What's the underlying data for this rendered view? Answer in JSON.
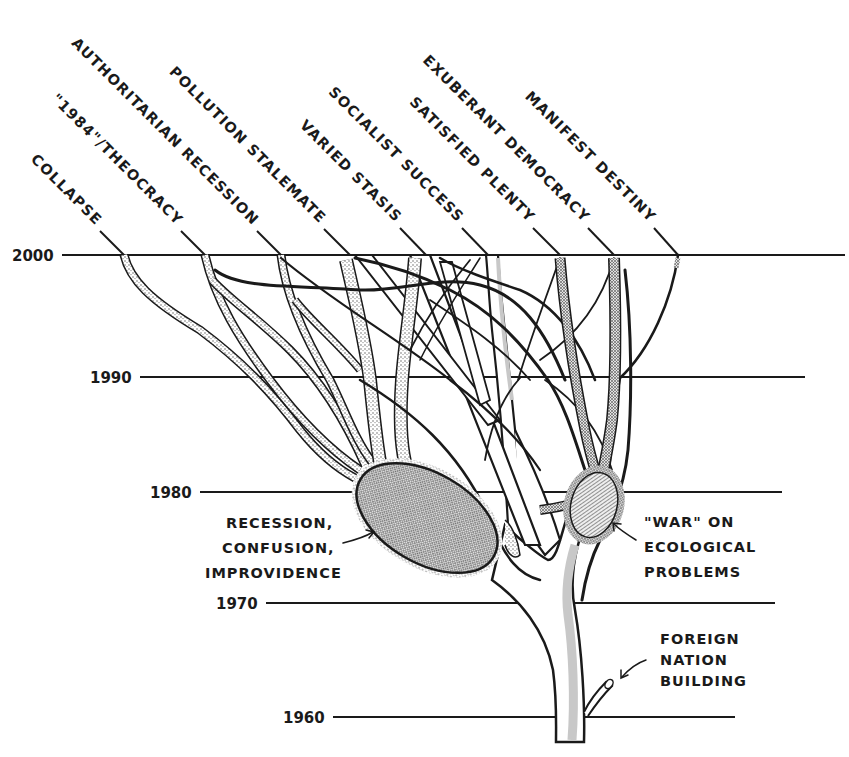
{
  "years": [
    {
      "label": "2000",
      "y": 255,
      "x_start": 62,
      "x_end": 845
    },
    {
      "label": "1990",
      "y": 377,
      "x_start": 140,
      "x_end": 805
    },
    {
      "label": "1980",
      "y": 492,
      "x_start": 200,
      "x_end": 782
    },
    {
      "label": "1970",
      "y": 603,
      "x_start": 266,
      "x_end": 775
    },
    {
      "label": "1960",
      "y": 717,
      "x_start": 333,
      "x_end": 735
    }
  ],
  "futures": [
    {
      "label": "COLLAPSE",
      "end_x": 124
    },
    {
      "label": "\"1984\"/THEOCRACY",
      "end_x": 205
    },
    {
      "label": "AUTHORITARIAN RECESSION",
      "end_x": 281
    },
    {
      "label": "POLLUTION STALEMATE",
      "end_x": 350
    },
    {
      "label": "VARIED STASIS",
      "end_x": 426
    },
    {
      "label": "SOCIALIST SUCCESS",
      "end_x": 488
    },
    {
      "label": "SATISFIED PLENTY",
      "end_x": 560
    },
    {
      "label": "EXUBERANT DEMOCRACY",
      "end_x": 614
    },
    {
      "label": "MANIFEST DESTINY",
      "end_x": 678
    }
  ],
  "annotations": {
    "recession": [
      "RECESSION,",
      "CONFUSION,",
      "IMPROVIDENCE"
    ],
    "ecology": [
      "\"WAR\" ON",
      "ECOLOGICAL",
      "PROBLEMS"
    ],
    "foreign": [
      "FOREIGN",
      "NATION",
      "BUILDING"
    ]
  },
  "colors": {
    "ink": "#1a1a1a",
    "background": "#ffffff",
    "stipple": "#cfcfcf",
    "crosshatch": "#9a9a9a"
  }
}
